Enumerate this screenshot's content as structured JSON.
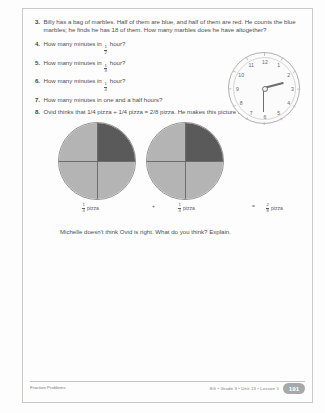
{
  "page": {
    "questions": [
      {
        "number": "3.",
        "text": "Billy has a bag of marbles. Half of them are blue, and half of them are red. He counts the blue marbles; he finds he has 18 of them. How many marbles does he have altogether?"
      },
      {
        "number": "4.",
        "prefix": "How many minutes in",
        "fraction": {
          "num": "1",
          "den": "2"
        },
        "suffix": "hour?"
      },
      {
        "number": "5.",
        "prefix": "How many minutes in",
        "fraction": {
          "num": "1",
          "den": "3"
        },
        "suffix": "hour?"
      },
      {
        "number": "6.",
        "prefix": "How many minutes in",
        "fraction": {
          "num": "1",
          "den": "4"
        },
        "suffix": "hour?"
      },
      {
        "number": "7.",
        "text": "How many minutes in one and a half hours?"
      },
      {
        "number": "8.",
        "text": "Ovid thinks that 1/4 pizza + 1/4 pizza = 2/8 pizza. He makes this picture to show he's right."
      }
    ],
    "clock": {
      "numbers": [
        "12",
        "1",
        "2",
        "3",
        "4",
        "5",
        "6",
        "7",
        "8",
        "9",
        "10",
        "11"
      ],
      "hour_hand_degrees": 75,
      "minute_hand_degrees": 180
    },
    "pizzas": [
      {
        "name": "pizza-one",
        "shaded_quadrant": "top-right",
        "shaded_color": "#5a5a5a",
        "unshaded_color": "#b4b4b4"
      },
      {
        "name": "pizza-two",
        "shaded_quadrant": "top-right",
        "shaded_color": "#5a5a5a",
        "unshaded_color": "#b4b4b4"
      }
    ],
    "equation": {
      "term1": {
        "num": "1",
        "den": "4",
        "unit": "pizza"
      },
      "operator_plus": "+",
      "term2": {
        "num": "1",
        "den": "4",
        "unit": "pizza"
      },
      "operator_equals": "=",
      "result": {
        "num": "2",
        "den": "8",
        "unit": "pizza"
      }
    },
    "closing_prompt": "Michelle doesn't think Ovid is right. What do you think? Explain.",
    "footer": {
      "left": "Fraction Problems",
      "right": "SG • Grade 3 • Unit 13 • Lesson 5",
      "page_number": "191"
    }
  }
}
